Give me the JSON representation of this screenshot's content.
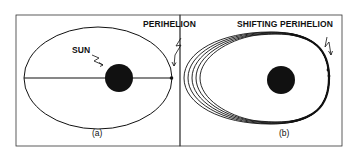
{
  "figure": {
    "panel_a": {
      "caption": "(a)",
      "labels": {
        "sun": "SUN",
        "perihelion": "PERIHELION"
      }
    },
    "panel_b": {
      "caption": "(b)",
      "labels": {
        "shifting_perihelion": "SHIFTING PERIHELION"
      }
    },
    "colors": {
      "ink": "#111111",
      "background": "#ffffff"
    }
  }
}
